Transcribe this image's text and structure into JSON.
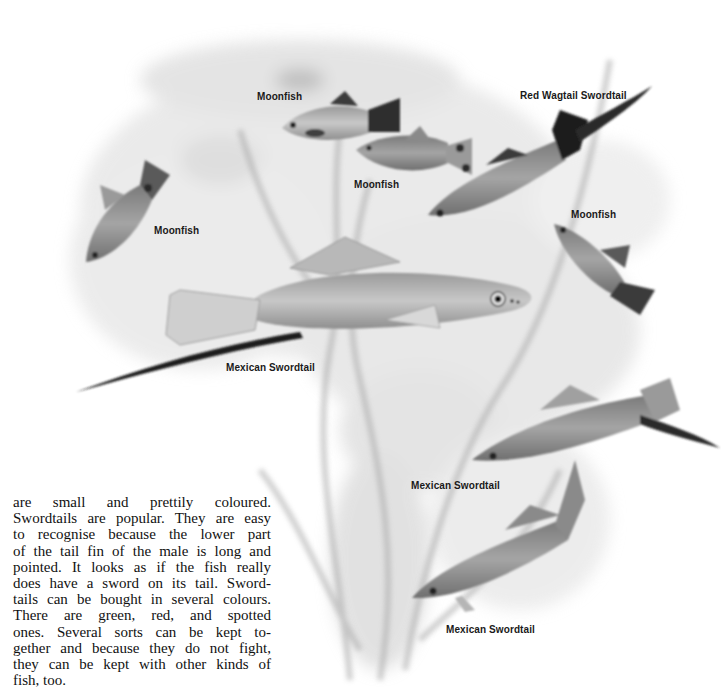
{
  "page": {
    "type": "book-page-illustration",
    "colors": {
      "background": "#ffffff",
      "ink": "#111111",
      "illustration_gray": "#8a8a8a",
      "dark_fin": "#2a2a2a"
    }
  },
  "illustration": {
    "labels": [
      {
        "id": "moonfish-top",
        "text": "Moonfish"
      },
      {
        "id": "red-wagtail-swordtail",
        "text": "Red Wagtail Swordtail"
      },
      {
        "id": "moonfish-middle",
        "text": "Moonfish"
      },
      {
        "id": "moonfish-left",
        "text": "Moonfish"
      },
      {
        "id": "moonfish-right",
        "text": "Moonfish"
      },
      {
        "id": "mexican-swordtail-large",
        "text": "Mexican Swordtail"
      },
      {
        "id": "mexican-swordtail-right",
        "text": "Mexican Swordtail"
      },
      {
        "id": "mexican-swordtail-bottom",
        "text": "Mexican Swordtail"
      }
    ]
  },
  "body_text": {
    "lines": [
      "are small and prettily coloured.",
      "Swordtails are popular. They are easy",
      "to recognise because the lower part",
      "of the tail fin of the male is long and",
      "pointed. It looks as if the fish really",
      "does have a sword on its tail. Sword-",
      "tails can be bought in several colours.",
      "There are green, red, and spotted",
      "ones. Several sorts can be kept to-",
      "gether and because they do not fight,",
      "they can be kept with other kinds of",
      "fish, too."
    ]
  }
}
